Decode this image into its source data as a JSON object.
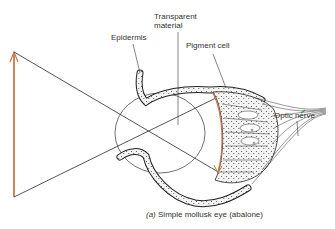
{
  "figure": {
    "title": "Simple mollusk eye (abalone)",
    "caption_part_label": "(a)",
    "caption_text": "Simple mollusk eye (abalone)"
  },
  "labels": {
    "epidermis": "Epidermis",
    "transparent_material_line1": "Transparent",
    "transparent_material_line2": "material",
    "pigment_cell": "Pigment cell",
    "optic_nerve": "Optic nerve"
  },
  "colors": {
    "object_arrow": "#c8784a",
    "image_arrow": "#c8784a",
    "line": "#2a2a2a",
    "nerve_highlight": "#3a9a3a"
  },
  "elements": [
    {
      "name": "object-arrow",
      "description": "Upright orange arrow representing the object outside the eye"
    },
    {
      "name": "light-rays",
      "description": "Two rays crossing at the eye opening (pinhole)"
    },
    {
      "name": "image-arrow",
      "description": "Inverted curved orange arrow projected on the retina"
    },
    {
      "name": "eye-cup",
      "description": "Cup of epidermal and pigment cells with transparent material inside"
    },
    {
      "name": "optic-nerve",
      "description": "Nerve fibers converging to the right"
    }
  ]
}
